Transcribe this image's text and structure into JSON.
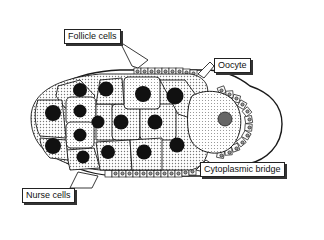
{
  "diagram": {
    "labels": {
      "follicle": "Follicle cells",
      "oocyte": "Oocyte",
      "bridge": "Cytoplasmic bridge",
      "nurse": "Nurse cells"
    },
    "colors": {
      "outline": "#1a1a1a",
      "stipple": "#9a9a9a",
      "nucleus": "#111111",
      "background": "#ffffff"
    }
  }
}
